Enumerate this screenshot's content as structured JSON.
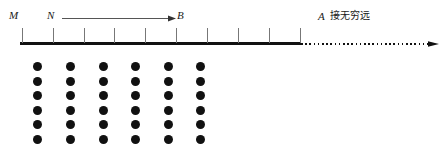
{
  "figure": {
    "type": "diagram",
    "labels": {
      "m": "M",
      "n": "N",
      "b": "B",
      "a": "A",
      "a_note": "接无穷远"
    },
    "axis": {
      "solid_start_x": 20,
      "solid_end_x": 301,
      "dotted_end_x": 429,
      "baseline_y": 43,
      "tick_count": 10,
      "tick_positions_x": [
        22,
        53,
        84,
        114,
        145,
        176,
        207,
        238,
        269,
        300
      ],
      "tick_top_y": 28,
      "has_end_arrow": true
    },
    "direction_arrow": {
      "from_label": "N",
      "to_label": "B",
      "start_x": 62,
      "end_x": 176,
      "y": 18
    },
    "dot_grid": {
      "rows": 6,
      "cols": 6,
      "diameter": 9,
      "col_positions_x": [
        33,
        66,
        99,
        131,
        164,
        196
      ],
      "row_positions_y": [
        62,
        77,
        91,
        106,
        120,
        135
      ],
      "color": "#111111"
    }
  }
}
